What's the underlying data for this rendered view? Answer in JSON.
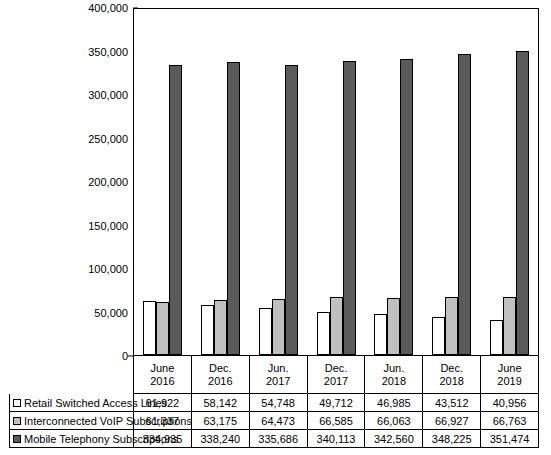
{
  "chart_data": {
    "type": "bar",
    "title": "",
    "xlabel": "",
    "ylabel": "",
    "ylim": [
      0,
      400000
    ],
    "yticks": [
      "0",
      "50,000",
      "100,000",
      "150,000",
      "200,000",
      "250,000",
      "300,000",
      "350,000",
      "400,000"
    ],
    "ytick_values": [
      0,
      50000,
      100000,
      150000,
      200000,
      250000,
      300000,
      350000,
      400000
    ],
    "grid": false,
    "legend_position": "bottom-table",
    "categories": [
      {
        "line1": "June",
        "line2": "2016"
      },
      {
        "line1": "Dec.",
        "line2": "2016"
      },
      {
        "line1": "Jun.",
        "line2": "2017"
      },
      {
        "line1": "Dec.",
        "line2": "2017"
      },
      {
        "line1": "Jun.",
        "line2": "2018"
      },
      {
        "line1": "Dec.",
        "line2": "2018"
      },
      {
        "line1": "June",
        "line2": "2019"
      }
    ],
    "series": [
      {
        "name": "Retail Switched Access Lines",
        "color": "#ffffff",
        "values": [
          61922,
          58142,
          54748,
          49712,
          46985,
          43512,
          40956
        ],
        "labels": [
          "61,922",
          "58,142",
          "54,748",
          "49,712",
          "46,985",
          "43,512",
          "40,956"
        ]
      },
      {
        "name": "Interconnected VoIP Subscriptions",
        "color": "#c0c0c0",
        "values": [
          61337,
          63175,
          64473,
          66585,
          66063,
          66927,
          66763
        ],
        "labels": [
          "61,337",
          "63,175",
          "64,473",
          "66,585",
          "66,063",
          "66,927",
          "66,763"
        ]
      },
      {
        "name": "Mobile Telephony Subscriptions",
        "color": "#5a5a5a",
        "values": [
          334935,
          338240,
          335686,
          340113,
          342560,
          348225,
          351474
        ],
        "labels": [
          "334,935",
          "338,240",
          "335,686",
          "340,113",
          "342,560",
          "348,225",
          "351,474"
        ]
      }
    ]
  }
}
